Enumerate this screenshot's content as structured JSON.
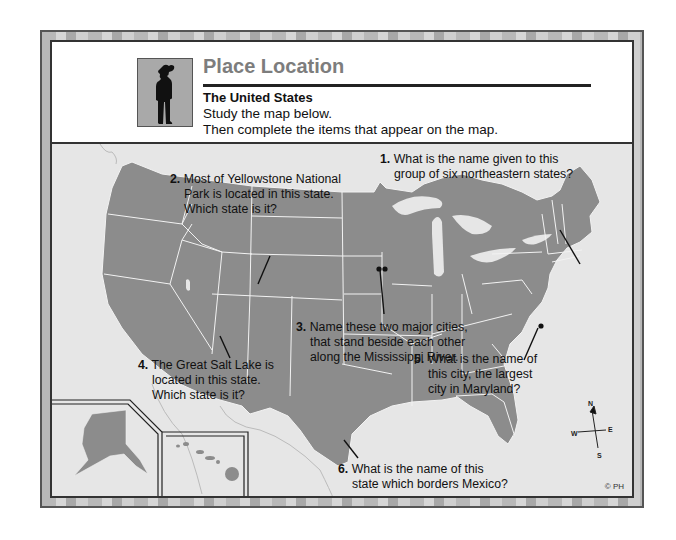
{
  "header": {
    "title": "Place Location",
    "subtitle": "The United States",
    "instruction_1": "Study the map below.",
    "instruction_2": "Then complete the items that appear on the map.",
    "icon": "person-silhouette-icon"
  },
  "map": {
    "land_color": "#8c8c8c",
    "water_color": "#e6e6e6",
    "border_color": "#f2f2f2",
    "compass": {
      "n": "N",
      "s": "S",
      "e": "E",
      "w": "W"
    },
    "copyright": "© PH",
    "insets": [
      "Alaska",
      "Hawaii"
    ]
  },
  "questions": [
    {
      "num": "1.",
      "line1": "What is the name given to this",
      "line2": "group of six northeastern states?"
    },
    {
      "num": "2.",
      "line1": "Most of Yellowstone National",
      "line2": "Park is located in this state.",
      "line3": "Which state is it?"
    },
    {
      "num": "3.",
      "line1": "Name these two major cities,",
      "line2": "that stand beside each other",
      "line3": "along the Mississippi River."
    },
    {
      "num": "4.",
      "line1": "The Great Salt Lake is",
      "line2": "located in this state.",
      "line3": "Which state is it?"
    },
    {
      "num": "5.",
      "line1": "What is the name of",
      "line2": "this city, the largest",
      "line3": "city in Maryland?"
    },
    {
      "num": "6.",
      "line1": "What is the name of this",
      "line2": "state which borders Mexico?"
    }
  ]
}
